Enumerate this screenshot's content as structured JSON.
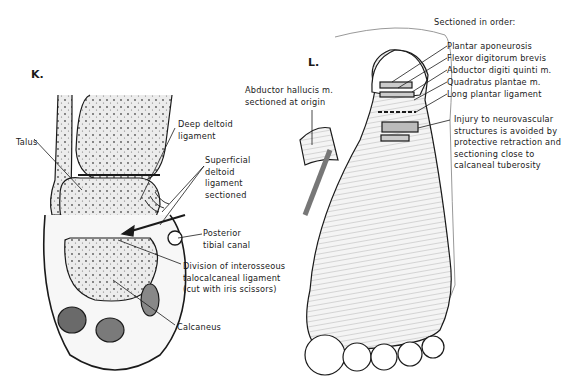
{
  "panels": [
    {
      "id": "K",
      "letter": "K.",
      "labels": {
        "talus": "Talus",
        "deep_deltoid": "Deep deltoid\nligament",
        "superficial_deltoid": "Superficial\ndeltoid\nligament\nsectioned",
        "posterior_tibial_canal": "Posterior\ntibial canal",
        "division_interosseous": "Division of interosseous\ntalocalcaneal ligament\n(cut with iris scissors)",
        "calcaneus": "Calcaneus"
      }
    },
    {
      "id": "L",
      "letter": "L.",
      "labels": {
        "sectioned_heading": "Sectioned in order:",
        "sectioned_order": [
          "Plantar aponeurosis",
          "Flexor digitorum brevis",
          "Abductor digiti quinti m.",
          "Quadratus plantae m.",
          "Long plantar ligament"
        ],
        "abductor_hallucis": "Abductor hallucis m.\nsectioned at origin",
        "injury_note": "Injury to neurovascular\nstructures is avoided by\nprotective retraction and\nsectioning close to\ncalcaneal tuberosity"
      }
    }
  ],
  "colors": {
    "ink": "#1a1a1a",
    "bone_fill": "#e6e6e6",
    "paper": "#ffffff"
  }
}
